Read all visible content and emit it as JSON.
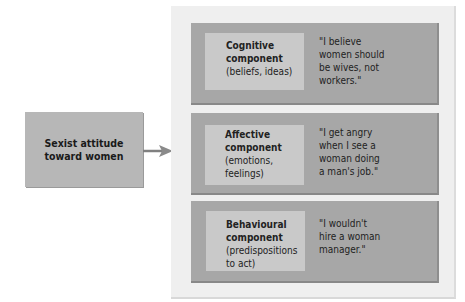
{
  "source": {
    "label_line1": "Sexist attitude",
    "label_line2": "toward women"
  },
  "components": [
    {
      "title_line1": "Cognitive",
      "title_line2": "component",
      "sub_line1": "(beliefs, ideas)",
      "sub_line2": "",
      "quote": "\"I believe\n women should\n be wives, not\n workers.\""
    },
    {
      "title_line1": "Affective",
      "title_line2": "component",
      "sub_line1": "(emotions,",
      "sub_line2": "feelings)",
      "quote": "\"I get angry\n when I see a\n woman doing\n a man's job.\""
    },
    {
      "title_line1": "Behavioural",
      "title_line2": "component",
      "sub_line1": "(predispositions",
      "sub_line2": "to act)",
      "quote": "\"I wouldn't\n hire a woman\n manager.\""
    }
  ],
  "colors": {
    "source_box": "#b7b7b7",
    "panel": "#efefef",
    "component_box": "#a7a7a7",
    "inner_box": "#c9c9c9",
    "arrow": "#7a7a7a"
  }
}
